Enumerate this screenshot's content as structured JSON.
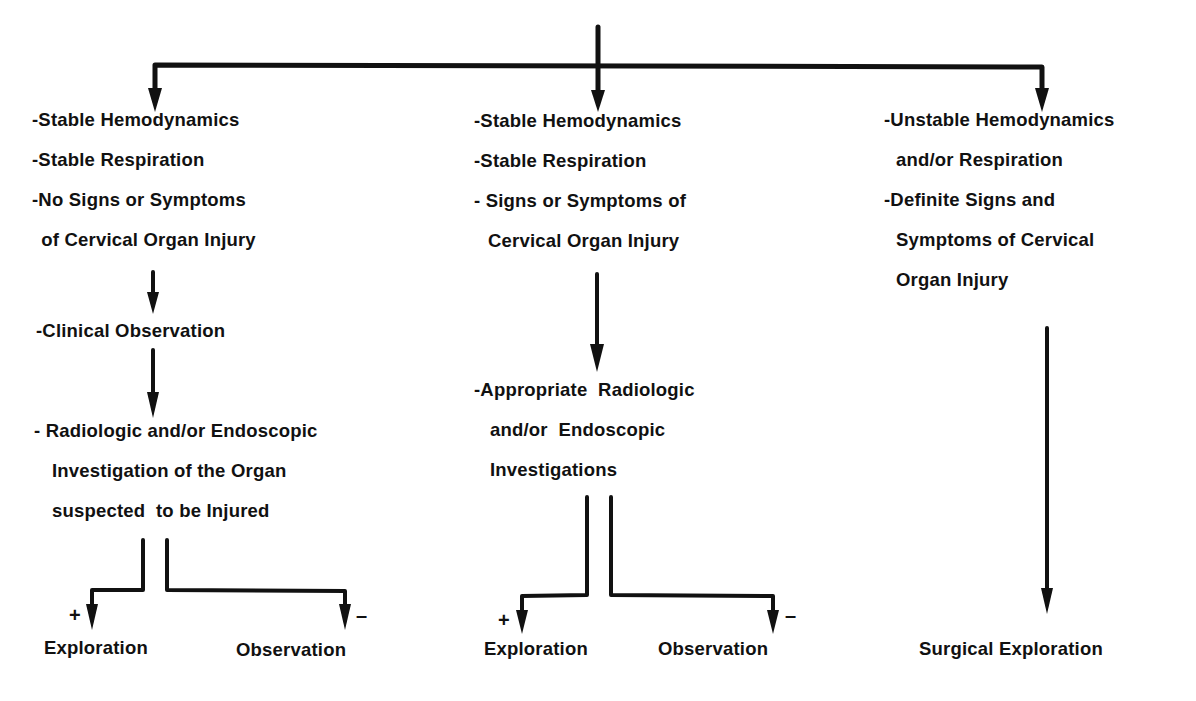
{
  "diagram": {
    "colors": {
      "ink": "#111111",
      "background": "#ffffff"
    },
    "columns": [
      {
        "id": "left",
        "criteria": [
          "-Stable Hemodynamics",
          "-Stable Respiration",
          "-No Signs or Symptoms",
          " of Cervical Organ Injury"
        ],
        "step1": "-Clinical Observation",
        "step2": [
          "- Radiologic and/or Endoscopic",
          "Investigation of the Organ",
          "suspected  to be Injured"
        ],
        "outcomes": {
          "positive_sign": "+",
          "positive_label": "Exploration",
          "negative_sign": "–",
          "negative_label": "Observation"
        }
      },
      {
        "id": "middle",
        "criteria": [
          "-Stable Hemodynamics",
          "-Stable Respiration",
          "- Signs or Symptoms of",
          "Cervical Organ Injury"
        ],
        "step1": [
          "-Appropriate  Radiologic",
          "and/or  Endoscopic",
          "Investigations"
        ],
        "outcomes": {
          "positive_sign": "+",
          "positive_label": "Exploration",
          "negative_sign": "–",
          "negative_label": "Observation"
        }
      },
      {
        "id": "right",
        "criteria": [
          "-Unstable Hemodynamics",
          "and/or Respiration",
          "-Definite Signs and",
          "Symptoms of Cervical",
          "Organ Injury"
        ],
        "outcome": "Surgical Exploration"
      }
    ]
  }
}
